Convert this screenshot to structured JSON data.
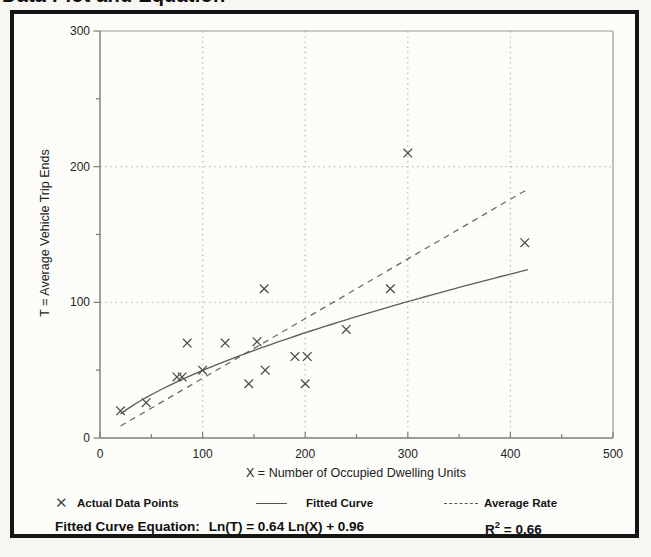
{
  "page": {
    "clipped_title": "Data Plot and Equation"
  },
  "chart_data": {
    "type": "scatter",
    "xlabel": "X = Number of Occupied Dwelling Units",
    "ylabel": "T = Average Vehicle Trip Ends",
    "xlim": [
      0,
      500
    ],
    "ylim": [
      0,
      300
    ],
    "x_ticks": [
      0,
      100,
      200,
      300,
      400,
      500
    ],
    "y_ticks": [
      0,
      100,
      200,
      300
    ],
    "x_minor_ticks": [
      50,
      150,
      250,
      350,
      450
    ],
    "y_minor_ticks": [
      50,
      150,
      250
    ],
    "grid": "dotted gridlines at 100-unit intervals, boxed plot area",
    "legend_position": "bottom row, outside plot",
    "points": [
      [
        20,
        20
      ],
      [
        45,
        26
      ],
      [
        75,
        45
      ],
      [
        80,
        45
      ],
      [
        85,
        70
      ],
      [
        100,
        50
      ],
      [
        122,
        70
      ],
      [
        145,
        40
      ],
      [
        153,
        71
      ],
      [
        160,
        110
      ],
      [
        161,
        50
      ],
      [
        190,
        60
      ],
      [
        200,
        40
      ],
      [
        202,
        60
      ],
      [
        240,
        80
      ],
      [
        283,
        110
      ],
      [
        300,
        210
      ],
      [
        414,
        144
      ]
    ],
    "fitted_curve": {
      "model": "Ln(T) = a Ln(X) + b",
      "a": 0.64,
      "b": 0.96,
      "x_range": [
        20,
        417
      ]
    },
    "average_rate": {
      "rate": 0.44,
      "x_range": [
        20,
        417
      ]
    },
    "legend": [
      {
        "marker": "x-cross",
        "label": "Actual Data Points"
      },
      {
        "marker": "solid-line",
        "label": "Fitted Curve"
      },
      {
        "marker": "dashed-line",
        "label": "Average Rate"
      }
    ],
    "equation_label": "Fitted Curve Equation:",
    "equation": "Ln(T) = 0.64 Ln(X) + 0.96",
    "r_squared": {
      "base": "R",
      "sup": "2",
      "rest": " = 0.66"
    }
  }
}
